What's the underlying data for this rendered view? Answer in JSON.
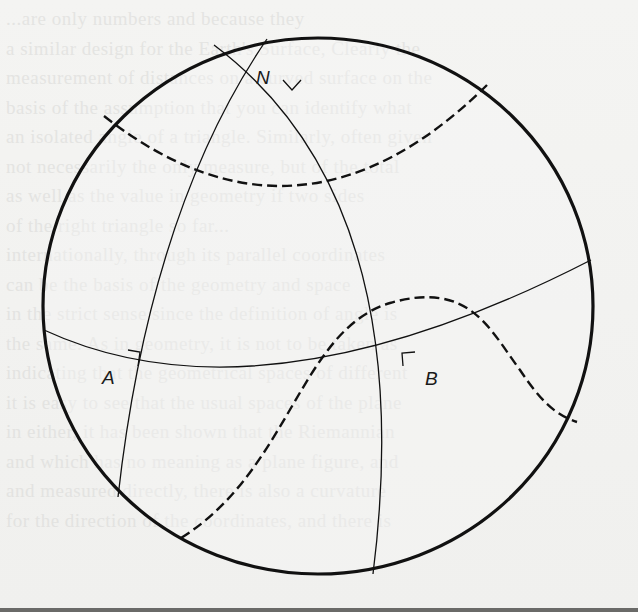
{
  "figure": {
    "type": "spherical-geometry-diagram",
    "labels": {
      "north_pole": "N",
      "point_a": "A",
      "point_b": "B"
    },
    "colors": {
      "ink": "#111111",
      "paper": "#f3f3f1",
      "ghost_text": "#d8d8d6"
    }
  },
  "background_text": {
    "lines": [
      "...are only numbers and because they",
      "a similar design for the Earth's Surface, Clearly the",
      "measurement of distances on a curved surface on the",
      "basis of the assumption that you can identify what",
      "an isolated angle of a triangle. Similarly, often given",
      "not necessarily the only measure, but of the total",
      "as well as the value in geometry if two sides",
      "of the right triangle so far...",
      "internationally, through its parallel coordinates",
      "can be the basis of the geometry and space",
      "in the strict sense since the definition of angle is",
      "the same. As in geometry, it is not to be taken as",
      "indicating that the geometrical spaces of different",
      "it is easy to see that the usual spaces of the plane",
      "in either, it has been shown that the Riemannian",
      "and which has no meaning as a plane figure, and",
      "and measured directly, there is also a curvature",
      "for the direction of the coordinates, and there is"
    ]
  }
}
